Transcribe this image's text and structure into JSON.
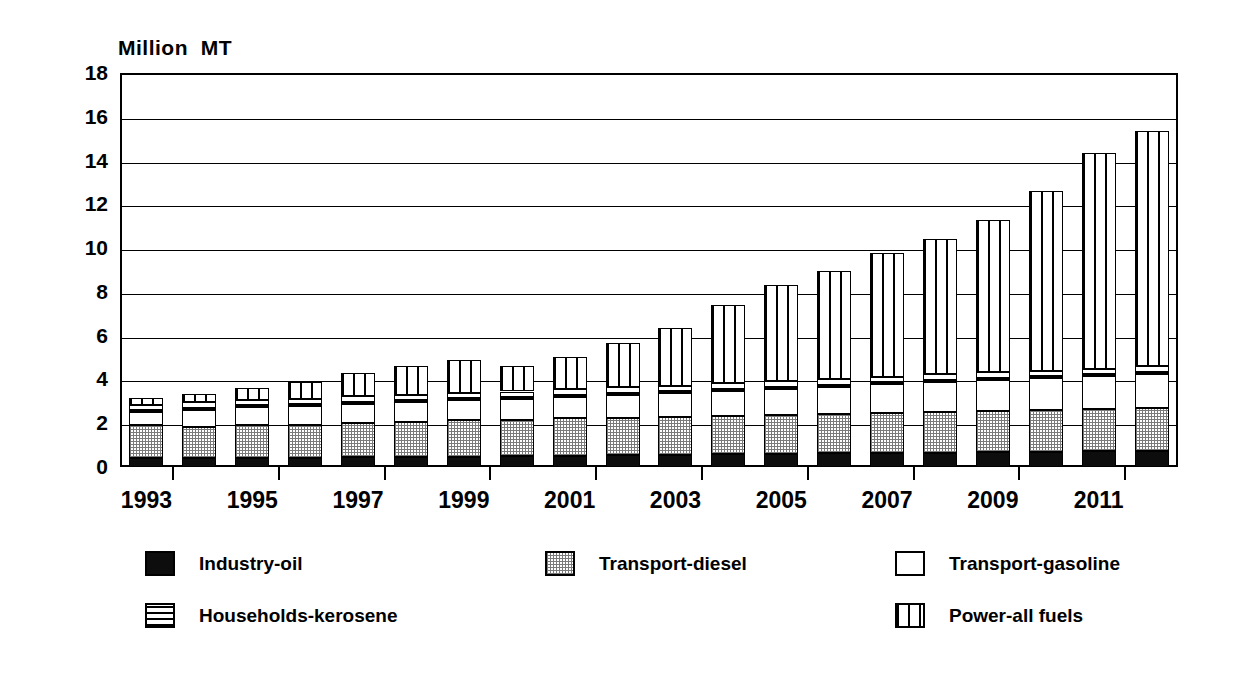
{
  "chart_data": {
    "type": "bar",
    "subtype": "stacked-bar",
    "title": "",
    "ylabel": "Million  MT",
    "xlabel": "",
    "ylim": [
      0,
      18
    ],
    "ytick_step": 2,
    "yticks": [
      18,
      16,
      14,
      12,
      10,
      8,
      6,
      4,
      2,
      0
    ],
    "grid": true,
    "legend_position": "bottom",
    "categories": [
      "1993",
      "1994",
      "1995",
      "1996",
      "1997",
      "1998",
      "1999",
      "2000",
      "2001",
      "2002",
      "2003",
      "2004",
      "2005",
      "2006",
      "2007",
      "2008",
      "2009",
      "2010",
      "2011",
      "2012"
    ],
    "xtick_labels": [
      "1993",
      "1995",
      "1997",
      "1999",
      "2001",
      "2003",
      "2005",
      "2007",
      "2009",
      "2011"
    ],
    "series": [
      {
        "name": "Industry-oil",
        "pattern": "solid-black",
        "color": "#0d0d0d",
        "values": [
          0.4,
          0.4,
          0.42,
          0.42,
          0.45,
          0.45,
          0.48,
          0.5,
          0.52,
          0.55,
          0.55,
          0.58,
          0.6,
          0.62,
          0.62,
          0.65,
          0.68,
          0.7,
          0.72,
          0.75
        ]
      },
      {
        "name": "Transport-diesel",
        "pattern": "gray-dotted",
        "color": "#c8c8c8",
        "values": [
          1.5,
          1.45,
          1.48,
          1.5,
          1.55,
          1.6,
          1.65,
          1.65,
          1.7,
          1.7,
          1.72,
          1.75,
          1.78,
          1.8,
          1.85,
          1.88,
          1.9,
          1.9,
          1.92,
          1.95
        ]
      },
      {
        "name": "Transport-gasoline",
        "pattern": "white",
        "color": "#ffffff",
        "values": [
          0.6,
          0.75,
          0.82,
          0.85,
          0.88,
          0.9,
          0.92,
          0.95,
          1.0,
          1.05,
          1.1,
          1.15,
          1.2,
          1.25,
          1.3,
          1.35,
          1.4,
          1.45,
          1.5,
          1.55
        ]
      },
      {
        "name": "Households-kerosene",
        "pattern": "horizontal-lines",
        "color": "#ffffff",
        "values": [
          0.35,
          0.35,
          0.35,
          0.35,
          0.35,
          0.35,
          0.35,
          0.35,
          0.35,
          0.35,
          0.35,
          0.35,
          0.35,
          0.35,
          0.35,
          0.35,
          0.35,
          0.35,
          0.35,
          0.35
        ]
      },
      {
        "name": "Power-all fuels",
        "pattern": "vertical-lines",
        "color": "#ffffff",
        "values": [
          0.3,
          0.4,
          0.55,
          0.75,
          1.05,
          1.3,
          1.5,
          1.15,
          1.45,
          2.0,
          2.65,
          3.55,
          4.4,
          4.95,
          5.65,
          6.2,
          6.95,
          8.2,
          9.85,
          10.75
        ]
      }
    ],
    "totals": [
      3.15,
      3.35,
      3.62,
      3.87,
      4.28,
      4.6,
      4.9,
      4.6,
      5.02,
      5.65,
      6.37,
      7.38,
      8.33,
      9.02,
      9.77,
      10.43,
      11.28,
      12.6,
      14.34,
      15.35
    ]
  },
  "legend": {
    "items": [
      {
        "label": "Industry-oil",
        "swatch": "solid-black-swatch"
      },
      {
        "label": "Transport-diesel",
        "swatch": "gray-dotted-swatch"
      },
      {
        "label": "Transport-gasoline",
        "swatch": "white-swatch"
      },
      {
        "label": "Households-kerosene",
        "swatch": "horizontal-lines-swatch"
      },
      {
        "label": "Power-all fuels",
        "swatch": "vertical-lines-swatch"
      }
    ]
  }
}
